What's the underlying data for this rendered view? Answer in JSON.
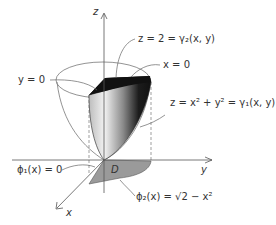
{
  "diagram": {
    "axes": {
      "z": "z",
      "y": "y",
      "x": "x"
    },
    "labels": {
      "top_surface": "z = 2 = γ₂(x, y)",
      "x_plane": "x = 0",
      "y_plane": "y = 0",
      "bottom_surface": "z = x² + y² = γ₁(x, y)",
      "phi1": "ϕ₁(x) = 0",
      "region": "D",
      "phi2": "ϕ₂(x) = √2 − x²"
    },
    "colors": {
      "solid_top": "#111111",
      "solid_shade_dark": "#1a1a1a",
      "solid_shade_light": "#f0f0f0",
      "region_fill": "#9a9a9a",
      "lines": "#555555"
    }
  }
}
